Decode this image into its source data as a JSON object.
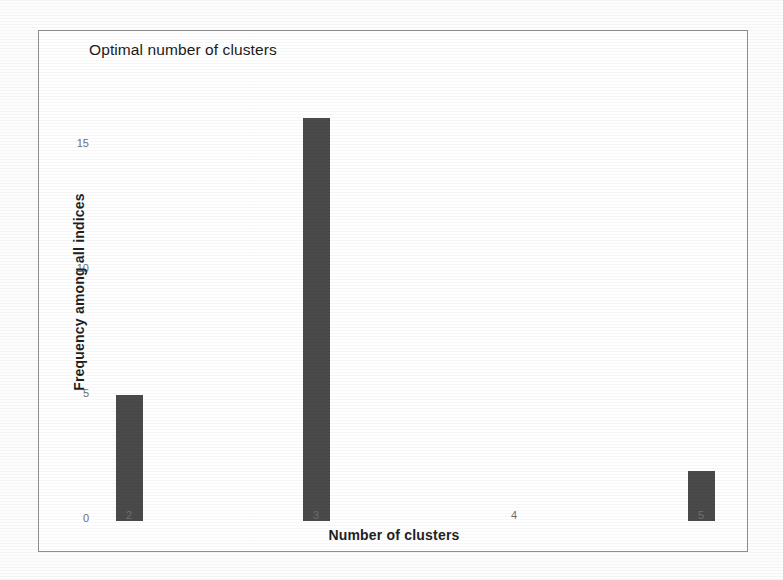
{
  "chart_data": {
    "type": "bar",
    "title": "Optimal number of clusters",
    "xlabel": "Number of clusters",
    "ylabel": "Frequency among all indices",
    "categories": [
      "2",
      "3",
      "4",
      "5"
    ],
    "values": [
      5,
      16,
      0,
      2
    ],
    "x_tick_labels": [
      "2",
      "3",
      "4",
      "5"
    ],
    "y_tick_labels": [
      "0",
      "5",
      "10",
      "15"
    ],
    "y_tick_values": [
      0,
      5,
      10,
      15
    ],
    "ylim": [
      0,
      17
    ],
    "grid": false,
    "legend": false,
    "bar_color": "#4a4a4a",
    "background_color": "#ffffff",
    "frame_color": "#8e8e90"
  }
}
